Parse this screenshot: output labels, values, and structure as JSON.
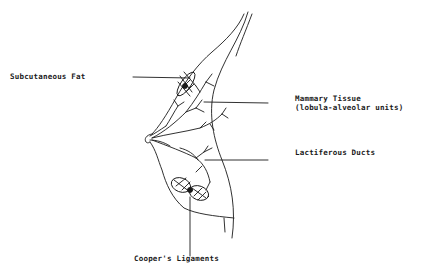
{
  "diagram": {
    "type": "anatomical-line-drawing",
    "labels": [
      {
        "id": "subcutaneous-fat",
        "text": "Subcutaneous Fat"
      },
      {
        "id": "mammary-tissue",
        "line1": "Mammary Tissue",
        "line2": "(lobula-alveolar units)"
      },
      {
        "id": "lactiferous-ducts",
        "text": "Lactiferous Ducts"
      },
      {
        "id": "coopers-ligaments",
        "text": "Cooper's Ligaments"
      }
    ],
    "colors": {
      "ink": "#1a1a1a",
      "background": "#ffffff"
    }
  }
}
